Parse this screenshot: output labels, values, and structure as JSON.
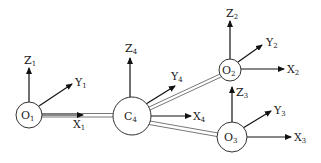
{
  "diagram": {
    "nodes": [
      {
        "id": "O1",
        "base": "O",
        "sub": "1",
        "cx": 29,
        "cy": 115,
        "r": 13
      },
      {
        "id": "C4",
        "base": "C",
        "sub": "4",
        "cx": 132,
        "cy": 116,
        "r": 19
      },
      {
        "id": "O2",
        "base": "O",
        "sub": "2",
        "cx": 230,
        "cy": 70,
        "r": 11
      },
      {
        "id": "O3",
        "base": "O",
        "sub": "3",
        "cx": 232,
        "cy": 137,
        "r": 15
      }
    ],
    "axes": {
      "O1": {
        "Z": {
          "base": "Z",
          "sub": "1"
        },
        "Y": {
          "base": "Y",
          "sub": "1"
        },
        "X": {
          "base": "X",
          "sub": "1"
        }
      },
      "C4": {
        "Z": {
          "base": "Z",
          "sub": "4"
        },
        "Y": {
          "base": "Y",
          "sub": "4"
        },
        "X": {
          "base": "X",
          "sub": "4"
        }
      },
      "O2": {
        "Z": {
          "base": "Z",
          "sub": "2"
        },
        "Y": {
          "base": "Y",
          "sub": "2"
        },
        "X": {
          "base": "X",
          "sub": "2"
        }
      },
      "O3": {
        "Z": {
          "base": "Z",
          "sub": "3"
        },
        "Y": {
          "base": "Y",
          "sub": "3"
        },
        "X": {
          "base": "X",
          "sub": "3"
        }
      }
    },
    "links": [
      {
        "from": "O1",
        "to": "C4"
      },
      {
        "from": "C4",
        "to": "O2"
      },
      {
        "from": "C4",
        "to": "O3"
      }
    ]
  }
}
